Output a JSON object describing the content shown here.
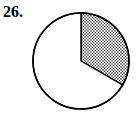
{
  "problem": {
    "number": "26."
  },
  "chart_data": {
    "type": "pie",
    "title": "",
    "slices": [
      {
        "label": "shaded",
        "fraction": 0.3333,
        "degrees": 120,
        "fill": "dotted"
      },
      {
        "label": "unshaded",
        "fraction": 0.6667,
        "degrees": 240,
        "fill": "none"
      }
    ],
    "start_angle": "12 o'clock",
    "direction": "clockwise",
    "legend": "none"
  },
  "colors": {
    "stroke": "#000000",
    "background": "#ffffff",
    "dots": "#000000"
  }
}
